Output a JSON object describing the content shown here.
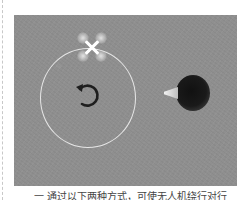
{
  "figure": {
    "background_color": "#8f8f8f",
    "orbit_circle_color": "#e6e6e6",
    "arrow_icon": "rotate-counterclockwise-icon",
    "arrow_color": "#1e1e1e"
  },
  "caption": {
    "text": "一 通过以下两种方式，可使无人机绕行对行"
  }
}
